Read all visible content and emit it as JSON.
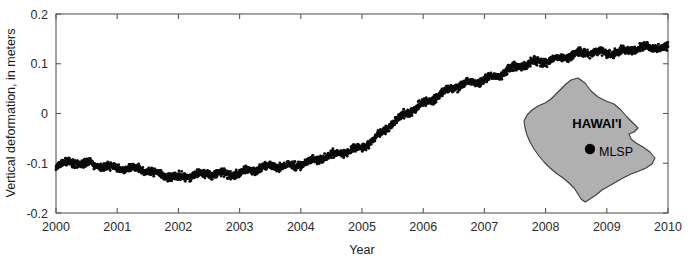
{
  "chart_data": {
    "type": "scatter",
    "title": "",
    "xlabel": "Year",
    "ylabel": "Vertical deformation, in meters",
    "xlim": [
      2000,
      2010
    ],
    "ylim": [
      -0.2,
      0.2
    ],
    "xticks": [
      2000,
      2001,
      2002,
      2003,
      2004,
      2005,
      2006,
      2007,
      2008,
      2009,
      2010
    ],
    "xtick_labels": [
      "2000",
      "2001",
      "2002",
      "2003",
      "2004",
      "2005",
      "2006",
      "2007",
      "2008",
      "2009",
      "2010"
    ],
    "yticks": [
      0.2,
      0.1,
      0,
      -0.1,
      -0.2
    ],
    "ytick_labels": [
      "0.2",
      "0.1",
      "0",
      "-0.1",
      "-0.2"
    ],
    "grid": false,
    "legend": null,
    "marker_color": "#0b0b0b",
    "scatter_noise": 0.011,
    "series": [
      {
        "name": "MLSP vertical deformation",
        "description": "Dense daily GPS solutions forming a continuous band",
        "trend_x": [
          2000.0,
          2000.25,
          2000.5,
          2000.75,
          2001.0,
          2001.25,
          2001.5,
          2001.75,
          2002.0,
          2002.25,
          2002.5,
          2002.75,
          2003.0,
          2003.25,
          2003.5,
          2003.75,
          2004.0,
          2004.25,
          2004.5,
          2004.75,
          2005.0,
          2005.25,
          2005.5,
          2005.75,
          2006.0,
          2006.25,
          2006.5,
          2006.75,
          2007.0,
          2007.25,
          2007.5,
          2007.75,
          2008.0,
          2008.25,
          2008.5,
          2008.75,
          2009.0,
          2009.25,
          2009.5,
          2009.75,
          2010.0
        ],
        "trend_y": [
          -0.1,
          -0.101,
          -0.102,
          -0.104,
          -0.107,
          -0.112,
          -0.118,
          -0.123,
          -0.126,
          -0.126,
          -0.124,
          -0.121,
          -0.117,
          -0.113,
          -0.109,
          -0.105,
          -0.1,
          -0.094,
          -0.087,
          -0.078,
          -0.066,
          -0.046,
          -0.022,
          0.002,
          0.022,
          0.038,
          0.05,
          0.06,
          0.07,
          0.08,
          0.09,
          0.099,
          0.107,
          0.113,
          0.118,
          0.121,
          0.124,
          0.127,
          0.129,
          0.131,
          0.133
        ]
      }
    ]
  },
  "inset": {
    "island_label": "HAWAI'I",
    "station_label": "MLSP",
    "island_fill": "#b0b0b0",
    "island_stroke": "#3d3d3d"
  }
}
